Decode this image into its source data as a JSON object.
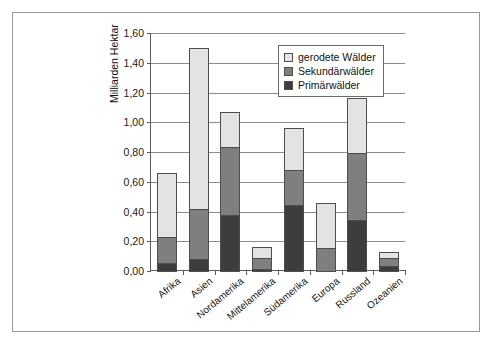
{
  "chart_data": {
    "type": "bar",
    "stacked": true,
    "title": "",
    "xlabel": "",
    "ylabel": "Milliarden Hektar",
    "ylim": [
      0,
      1.6
    ],
    "ytick_step": 0.2,
    "grid": true,
    "legend_position": "top-right",
    "decimal_separator": ",",
    "categories": [
      "Afrika",
      "Asien",
      "Nordamerika",
      "Mittelamerika",
      "Südamerika",
      "Europa",
      "Russland",
      "Ozeanien"
    ],
    "ytick_labels": [
      "0,00",
      "0,20",
      "0,40",
      "0,60",
      "0,80",
      "1,00",
      "1,20",
      "1,40",
      "1,60"
    ],
    "ytick_values": [
      0.0,
      0.2,
      0.4,
      0.6,
      0.8,
      1.0,
      1.2,
      1.4,
      1.6
    ],
    "series": [
      {
        "name": "Primärwälder",
        "color": "#3d3d3d",
        "values": [
          0.06,
          0.09,
          0.38,
          0.02,
          0.45,
          0.0,
          0.35,
          0.04
        ]
      },
      {
        "name": "Sekundärwälder",
        "color": "#7f7f7f",
        "values": [
          0.18,
          0.34,
          0.47,
          0.08,
          0.24,
          0.16,
          0.46,
          0.06
        ]
      },
      {
        "name": "gerodete Wälder",
        "color": "#e3e3e3",
        "values": [
          0.44,
          1.09,
          0.24,
          0.08,
          0.29,
          0.31,
          0.37,
          0.05
        ]
      }
    ],
    "totals": [
      0.68,
      1.52,
      1.09,
      0.18,
      0.98,
      0.47,
      1.18,
      0.15
    ],
    "legend": [
      {
        "label": "gerodete Wälder",
        "swatch": "light"
      },
      {
        "label": "Sekundärwälder",
        "swatch": "mid"
      },
      {
        "label": "Primärwälder",
        "swatch": "dark"
      }
    ]
  }
}
